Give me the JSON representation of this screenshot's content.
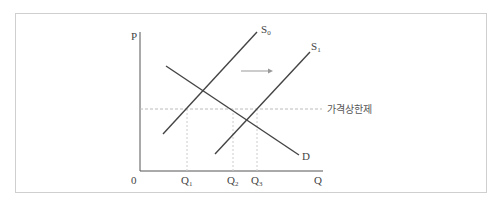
{
  "diagram": {
    "axes": {
      "y_label": "P",
      "x_label": "Q",
      "origin_label": "0"
    },
    "curves": {
      "supply_0": {
        "label": "S",
        "subscript": "0"
      },
      "supply_1": {
        "label": "S",
        "subscript": "1"
      },
      "demand": {
        "label": "D"
      }
    },
    "price_ceiling_label": "가격상한제",
    "quantities": [
      {
        "label": "Q",
        "subscript": "1"
      },
      {
        "label": "Q",
        "subscript": "2"
      },
      {
        "label": "Q",
        "subscript": "3"
      }
    ],
    "shift_arrow": "right-arrow",
    "colors": {
      "curve": "#444444",
      "axis": "#555555",
      "dashed": "#bbbbbb",
      "arrow": "#999999",
      "frame": "#cfcfcf"
    }
  }
}
